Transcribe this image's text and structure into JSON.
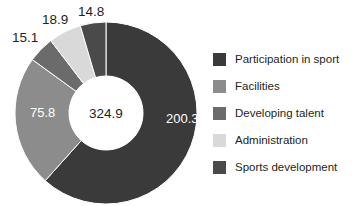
{
  "chart_data": {
    "type": "pie",
    "variant": "donut",
    "title": "",
    "subtitle": "",
    "xlabel": "",
    "ylabel": "",
    "center_label": "324.9",
    "total": 324.9,
    "grid": false,
    "legend_position": "right",
    "start_angle_deg": 0,
    "direction": "clockwise",
    "outer_radius_px": 91,
    "inner_radius_px": 37,
    "center_px": [
      106,
      113
    ],
    "categories": [
      "Participation in sport",
      "Facilities",
      "Developing talent",
      "Administration",
      "Sports development"
    ],
    "values": [
      200.3,
      75.8,
      15.1,
      18.9,
      14.8
    ],
    "colors": [
      "#3a3a3a",
      "#8c8c8c",
      "#6b6b6b",
      "#d9d9d9",
      "#4a4a4a"
    ],
    "slices": [
      {
        "label": "Participation in sport",
        "value": 200.3,
        "value_text": "200.3",
        "color": "#3a3a3a",
        "label_fill": "#ffffff",
        "label_placement": "inside",
        "label_x": 166,
        "label_y": 123
      },
      {
        "label": "Facilities",
        "value": 75.8,
        "value_text": "75.8",
        "color": "#8c8c8c",
        "label_fill": "#ffffff",
        "label_placement": "inside",
        "label_x": 30,
        "label_y": 117
      },
      {
        "label": "Developing talent",
        "value": 15.1,
        "value_text": "15.1",
        "color": "#6b6b6b",
        "label_fill": "#231f20",
        "label_placement": "outside",
        "label_x": 12,
        "label_y": 42
      },
      {
        "label": "Administration",
        "value": 18.9,
        "value_text": "18.9",
        "color": "#d9d9d9",
        "label_fill": "#231f20",
        "label_placement": "outside",
        "label_x": 42,
        "label_y": 24
      },
      {
        "label": "Sports development",
        "value": 14.8,
        "value_text": "14.8",
        "color": "#4a4a4a",
        "label_fill": "#231f20",
        "label_placement": "outside",
        "label_x": 78,
        "label_y": 16
      }
    ],
    "legend": [
      {
        "label": "Participation in sport",
        "color": "#3a3a3a"
      },
      {
        "label": "Facilities",
        "color": "#8c8c8c"
      },
      {
        "label": "Developing talent",
        "color": "#6b6b6b"
      },
      {
        "label": "Administration",
        "color": "#d9d9d9"
      },
      {
        "label": "Sports development",
        "color": "#4a4a4a"
      }
    ]
  }
}
